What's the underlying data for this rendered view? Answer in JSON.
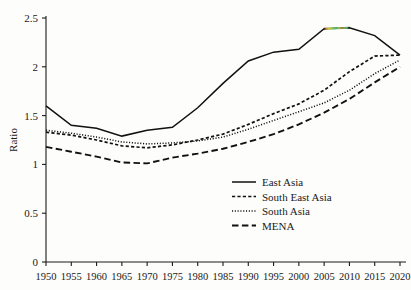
{
  "chart_data": {
    "type": "line",
    "title": "",
    "xlabel": "",
    "ylabel": "Ratio",
    "xlim": [
      1950,
      2020
    ],
    "ylim": [
      0,
      2.5
    ],
    "grid": false,
    "legend_position": "center-right",
    "x": [
      1950,
      1955,
      1960,
      1965,
      1970,
      1975,
      1980,
      1985,
      1990,
      1995,
      2000,
      2005,
      2010,
      2015,
      2020
    ],
    "xtick_labels": [
      "1950",
      "1955",
      "1960",
      "1965",
      "1970",
      "1975",
      "1980",
      "1985",
      "1990",
      "1995",
      "2000",
      "2005",
      "2010",
      "2015",
      "2020"
    ],
    "ytick_labels": [
      "0",
      "0.5",
      "1",
      "1.5",
      "2",
      "2.5"
    ],
    "ytick_values": [
      0,
      0.5,
      1,
      1.5,
      2,
      2.5
    ],
    "series": [
      {
        "name": "East Asia",
        "style": "solid",
        "values": [
          1.6,
          1.4,
          1.37,
          1.29,
          1.35,
          1.38,
          1.58,
          1.83,
          2.06,
          2.15,
          2.18,
          2.39,
          2.4,
          2.32,
          2.12
        ]
      },
      {
        "name": "South East Asia",
        "style": "dashed",
        "values": [
          1.33,
          1.3,
          1.25,
          1.19,
          1.17,
          1.2,
          1.25,
          1.31,
          1.41,
          1.52,
          1.62,
          1.76,
          1.95,
          2.11,
          2.12
        ]
      },
      {
        "name": "South Asia",
        "style": "dotted",
        "values": [
          1.35,
          1.32,
          1.28,
          1.23,
          1.21,
          1.22,
          1.24,
          1.28,
          1.36,
          1.45,
          1.54,
          1.63,
          1.76,
          1.93,
          2.07
        ]
      },
      {
        "name": "MENA",
        "style": "long-dash",
        "values": [
          1.18,
          1.13,
          1.08,
          1.02,
          1.01,
          1.07,
          1.11,
          1.16,
          1.23,
          1.31,
          1.41,
          1.53,
          1.67,
          1.84,
          2.0
        ]
      }
    ],
    "annotations": [
      {
        "kind": "scan-artifact",
        "description": "rainbow color fringe on East Asia peak segment",
        "x_range": [
          2005,
          2012
        ]
      }
    ],
    "colors": {
      "line": "#111111",
      "axis": "#1a1a1a",
      "background": "#fdfdfb"
    }
  },
  "legend": {
    "entries": [
      {
        "label": "East Asia"
      },
      {
        "label": "South East Asia"
      },
      {
        "label": "South Asia"
      },
      {
        "label": "MENA"
      }
    ]
  },
  "axes": {
    "y_title": "Ratio"
  }
}
